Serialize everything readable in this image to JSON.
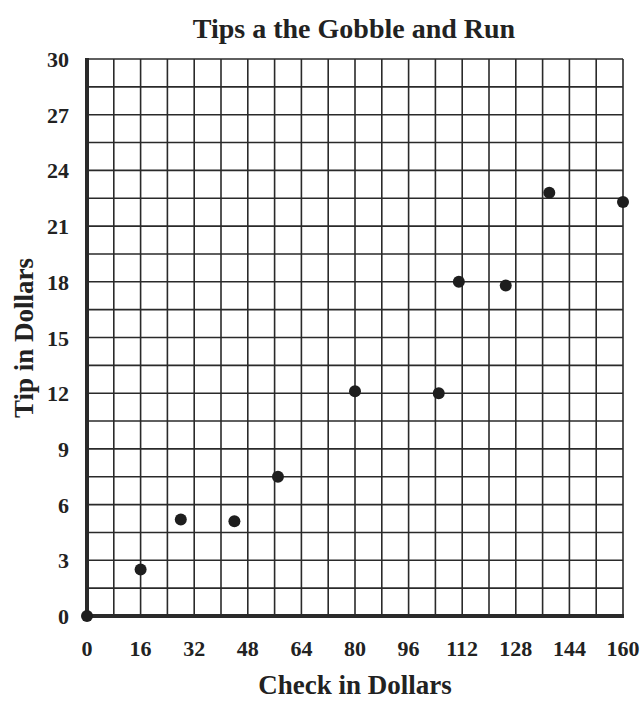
{
  "chart_data": {
    "type": "scatter",
    "title": "Tips a the Gobble and Run",
    "xlabel": "Check in Dollars",
    "ylabel": "Tip in Dollars",
    "xlim": [
      0,
      160
    ],
    "ylim": [
      0,
      30
    ],
    "x_ticks": [
      0,
      16,
      32,
      48,
      64,
      80,
      96,
      112,
      128,
      144,
      160
    ],
    "y_ticks": [
      0,
      3,
      6,
      9,
      12,
      15,
      18,
      21,
      24,
      27,
      30
    ],
    "x_grid_step": 8,
    "y_grid_step": 1.5,
    "grid": true,
    "legend": null,
    "points": [
      {
        "x": 0,
        "y": 0
      },
      {
        "x": 16,
        "y": 2.5
      },
      {
        "x": 28,
        "y": 5.2
      },
      {
        "x": 44,
        "y": 5.1
      },
      {
        "x": 57,
        "y": 7.5
      },
      {
        "x": 80,
        "y": 12.1
      },
      {
        "x": 105,
        "y": 12.0
      },
      {
        "x": 111,
        "y": 18.0
      },
      {
        "x": 125,
        "y": 17.8
      },
      {
        "x": 138,
        "y": 22.8
      },
      {
        "x": 160,
        "y": 22.3
      }
    ],
    "point_color": "#1e1e1e",
    "grid_color": "#2a2a2a"
  }
}
